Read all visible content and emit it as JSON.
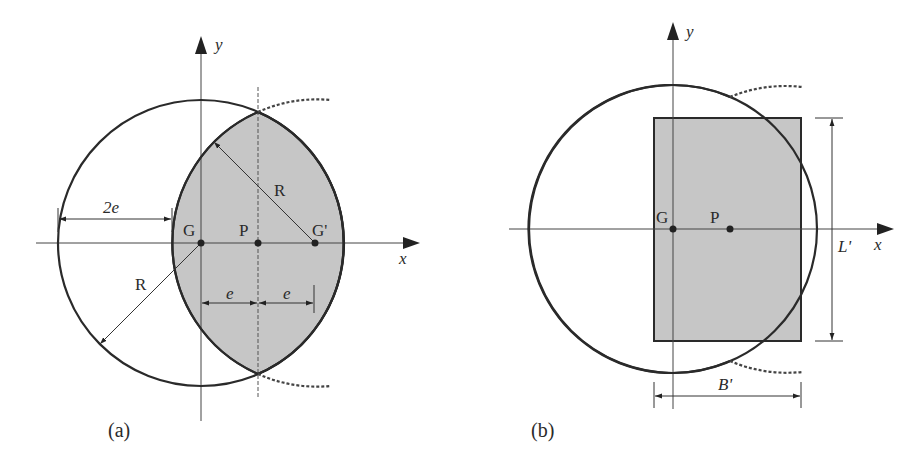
{
  "figure": {
    "panel_a": {
      "caption": "(a)",
      "axis_x_label": "x",
      "axis_y_label": "y",
      "point_g": "G",
      "point_p": "P",
      "point_g_prime": "G'",
      "radius_label_upper": "R",
      "radius_label_lower": "R",
      "dim_2e": "2e",
      "dim_e_left": "e",
      "dim_e_right": "e"
    },
    "panel_b": {
      "caption": "(b)",
      "axis_x_label": "x",
      "axis_y_label": "y",
      "point_g": "G",
      "point_p": "P",
      "dim_length": "L'",
      "dim_width": "B'"
    },
    "colors": {
      "shaded_area": "#c6c6c6",
      "line": "#2a2a2a"
    }
  }
}
